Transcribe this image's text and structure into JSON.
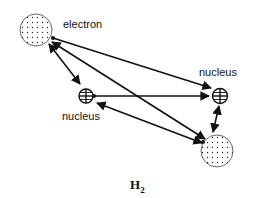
{
  "diagram": {
    "title": "H",
    "title_subscript": "2",
    "nodes": [
      {
        "id": "electron-1",
        "type": "electron",
        "label": "electron",
        "icon": "dotted-circle"
      },
      {
        "id": "nucleus-1",
        "type": "nucleus",
        "label": "nucleus",
        "icon": "circle-plus-grid"
      },
      {
        "id": "nucleus-2",
        "type": "nucleus",
        "label": "nucleus",
        "icon": "circle-plus-grid"
      },
      {
        "id": "electron-2",
        "type": "electron",
        "label": "",
        "icon": "dotted-circle"
      }
    ],
    "edges": [
      {
        "from": "electron-1",
        "to": "nucleus-1",
        "style": "double-arrow"
      },
      {
        "from": "electron-1",
        "to": "nucleus-2",
        "style": "arrow"
      },
      {
        "from": "electron-1",
        "to": "electron-2",
        "style": "double-arrow"
      },
      {
        "from": "nucleus-1",
        "to": "nucleus-2",
        "style": "double-arrow"
      },
      {
        "from": "nucleus-1",
        "to": "electron-2",
        "style": "double-arrow"
      },
      {
        "from": "nucleus-2",
        "to": "electron-2",
        "style": "double-arrow"
      }
    ],
    "colors": {
      "stroke": "#111111",
      "background": "#ffffff"
    }
  }
}
